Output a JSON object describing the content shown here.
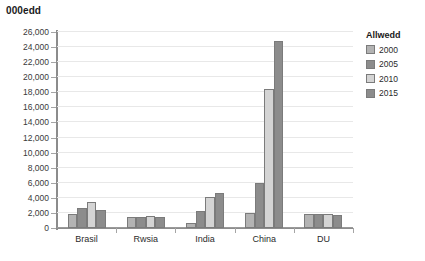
{
  "chart_data": {
    "type": "bar",
    "title": "000edd",
    "xlabel": "",
    "ylabel": "",
    "ylim": [
      0,
      26000
    ],
    "ytick_step": 2000,
    "grid": true,
    "legend_position": "right",
    "categories": [
      "Brasil",
      "Rwsia",
      "India",
      "China",
      "DU"
    ],
    "yticks": [
      "0",
      "2,000",
      "4,000",
      "6,000",
      "8,000",
      "10,000",
      "12,000",
      "14,000",
      "16,000",
      "18,000",
      "20,000",
      "22,000",
      "24,000",
      "26,000"
    ],
    "series": [
      {
        "name": "2000",
        "color": "#b3b3b3",
        "values": [
          1900,
          1500,
          700,
          2000,
          1800
        ]
      },
      {
        "name": "2005",
        "color": "#8c8c8c",
        "values": [
          2700,
          1500,
          2200,
          6000,
          1800
        ]
      },
      {
        "name": "2010",
        "color": "#d4d4d4",
        "values": [
          3500,
          1600,
          4100,
          18500,
          1850
        ]
      },
      {
        "name": "2015",
        "color": "#8c8c8c",
        "values": [
          2400,
          1500,
          4600,
          24800,
          1750
        ]
      }
    ]
  },
  "legend": {
    "title": "Allwedd"
  },
  "colors": {
    "axis": "#8c8c8c",
    "grid": "#e8e8e8",
    "text": "#2b2b2b",
    "background": "#ffffff"
  }
}
